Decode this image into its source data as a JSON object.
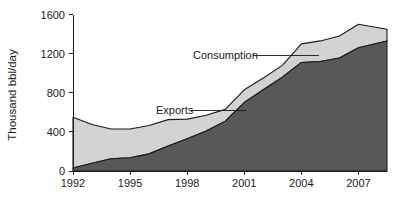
{
  "chart_data": {
    "type": "area",
    "stacked": true,
    "title": "",
    "subtitle": "",
    "xlabel": "",
    "ylabel": "Thousand bbl/day",
    "xlim": [
      1992,
      2008.5
    ],
    "ylim": [
      0,
      1600
    ],
    "grid": false,
    "legend_position": "inline-annotations",
    "x": [
      1992,
      1993,
      1994,
      1995,
      1996,
      1997,
      1998,
      1999,
      2000,
      2001,
      2002,
      2003,
      2004,
      2005,
      2006,
      2007,
      2008.5
    ],
    "xticks": [
      1992,
      1995,
      1998,
      2001,
      2004,
      2007
    ],
    "xticklabels": [
      "1992",
      "1995",
      "1998",
      "2001",
      "2004",
      "2007"
    ],
    "yticks": [
      0,
      400,
      800,
      1200,
      1600
    ],
    "yticklabels": [
      "0",
      "400",
      "800",
      "1200",
      "1600"
    ],
    "series": [
      {
        "name": "Exports",
        "color": "#58585a",
        "values": [
          30,
          80,
          125,
          135,
          175,
          255,
          330,
          410,
          510,
          700,
          830,
          960,
          1110,
          1120,
          1155,
          1260,
          1330
        ]
      },
      {
        "name": "Consumption",
        "color": "#d2d2d2",
        "values": [
          550,
          475,
          430,
          430,
          465,
          525,
          530,
          570,
          630,
          830,
          950,
          1080,
          1300,
          1330,
          1380,
          1500,
          1450
        ]
      }
    ],
    "annotations": [
      {
        "label": "Consumption",
        "label_x": 193,
        "label_y": 59,
        "leader_x1": 253,
        "leader_x2": 319,
        "leader_y": 55
      },
      {
        "label": "Exports",
        "label_x": 156,
        "label_y": 114,
        "leader_x1": 191,
        "leader_x2": 246,
        "leader_y": 110
      }
    ]
  }
}
